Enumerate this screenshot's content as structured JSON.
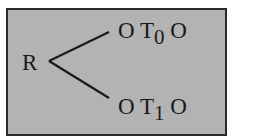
{
  "diagram": {
    "root": "R",
    "branches": [
      {
        "left": "O",
        "symbol": "T",
        "subscript": "0",
        "right": "O"
      },
      {
        "left": "O",
        "symbol": "T",
        "subscript": "1",
        "right": "O"
      }
    ],
    "colors": {
      "background": "#b3b3b3",
      "border": "#2a2a2a",
      "text": "#1a1a1a"
    }
  }
}
